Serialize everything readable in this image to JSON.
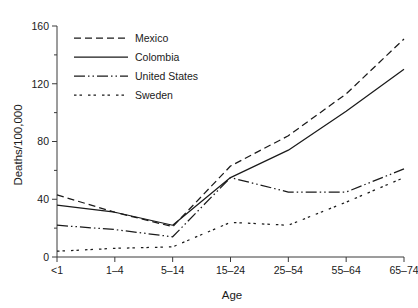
{
  "chart_data": {
    "type": "line",
    "title": "",
    "xlabel": "Age",
    "ylabel": "Deaths/100,000",
    "categories": [
      "<1",
      "1–4",
      "5–14",
      "15–24",
      "25–54",
      "55–64",
      "65–74"
    ],
    "ylim": [
      0,
      160
    ],
    "yticks": [
      0,
      20,
      40,
      60,
      80,
      100,
      120,
      140,
      160
    ],
    "ytick_labels": [
      "0",
      "20",
      "40",
      "60",
      "80",
      "100",
      "120",
      "140",
      "160"
    ],
    "grid": false,
    "legend_position": "top-left-inside",
    "series": [
      {
        "name": "Mexico",
        "dash": "dashed",
        "color": "#1a1a1a",
        "dasharray": "7,4",
        "values": [
          43,
          31,
          21,
          63,
          84,
          113,
          151
        ]
      },
      {
        "name": "Colombia",
        "dash": "solid",
        "color": "#1a1a1a",
        "dasharray": "",
        "values": [
          36,
          31,
          22,
          55,
          74,
          101,
          130
        ]
      },
      {
        "name": "United States",
        "dash": "dash-dot-dot",
        "color": "#1a1a1a",
        "dasharray": "11,3,1.5,3,1.5,3",
        "values": [
          22,
          19,
          14,
          55,
          45,
          45,
          61
        ]
      },
      {
        "name": "Sweden",
        "dash": "dotted",
        "color": "#1a1a1a",
        "dasharray": "2.5,3,2.5,6",
        "values": [
          4,
          6,
          7,
          24,
          22,
          38,
          55
        ]
      }
    ]
  },
  "axes": {
    "x_title": "Age",
    "y_title": "Deaths/100,000"
  },
  "legend": {
    "entries": [
      {
        "label": "Mexico"
      },
      {
        "label": "Colombia"
      },
      {
        "label": "United States"
      },
      {
        "label": "Sweden"
      }
    ]
  }
}
